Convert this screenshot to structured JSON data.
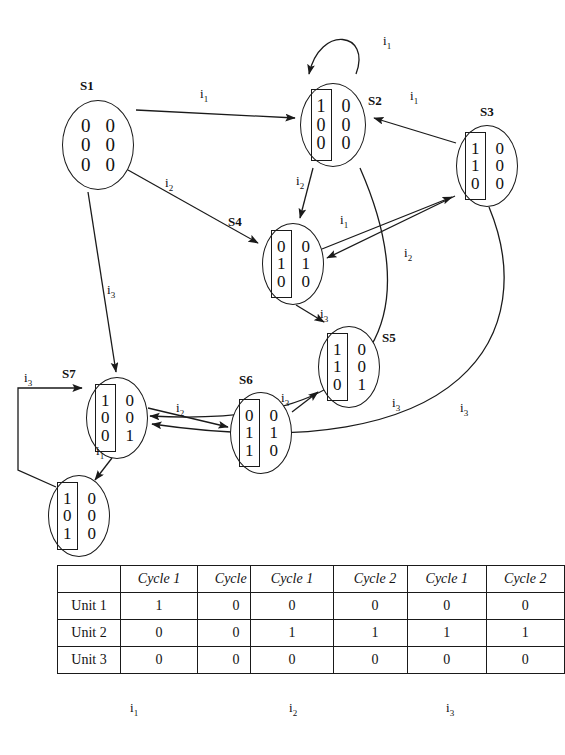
{
  "figure": {
    "type": "state-transition-diagram-with-tables",
    "inputs": [
      "i1",
      "i2",
      "i3"
    ]
  },
  "states": [
    {
      "id": "S1",
      "label": "S1",
      "boxed_column": false,
      "col1": [
        "0",
        "0",
        "0"
      ],
      "col2": [
        "0",
        "0",
        "0"
      ],
      "x": 62,
      "y": 100,
      "w": 72,
      "h": 90,
      "label_x": 80,
      "label_y": 78
    },
    {
      "id": "S2",
      "label": "S2",
      "boxed_column": true,
      "col1": [
        "1",
        "0",
        "0"
      ],
      "col2": [
        "0",
        "0",
        "0"
      ],
      "x": 300,
      "y": 83,
      "w": 66,
      "h": 84,
      "label_x": 368,
      "label_y": 93
    },
    {
      "id": "S3",
      "label": "S3",
      "boxed_column": true,
      "col1": [
        "1",
        "1",
        "0"
      ],
      "col2": [
        "0",
        "0",
        "0"
      ],
      "x": 456,
      "y": 125,
      "w": 62,
      "h": 82,
      "label_x": 480,
      "label_y": 104
    },
    {
      "id": "S4",
      "label": "S4",
      "boxed_column": true,
      "col1": [
        "0",
        "1",
        "0"
      ],
      "col2": [
        "0",
        "1",
        "0"
      ],
      "x": 262,
      "y": 223,
      "w": 62,
      "h": 82,
      "label_x": 228,
      "label_y": 214
    },
    {
      "id": "S5",
      "label": "S5",
      "boxed_column": true,
      "col1": [
        "1",
        "1",
        "0"
      ],
      "col2": [
        "0",
        "0",
        "1"
      ],
      "x": 318,
      "y": 326,
      "w": 62,
      "h": 82,
      "label_x": 382,
      "label_y": 330
    },
    {
      "id": "S6",
      "label": "S6",
      "boxed_column": true,
      "col1": [
        "0",
        "1",
        "1"
      ],
      "col2": [
        "0",
        "1",
        "0"
      ],
      "x": 230,
      "y": 392,
      "w": 62,
      "h": 82,
      "label_x": 239,
      "label_y": 372
    },
    {
      "id": "S7",
      "label": "S7",
      "boxed_column": true,
      "col1": [
        "1",
        "0",
        "0"
      ],
      "col2": [
        "0",
        "0",
        "1"
      ],
      "x": 86,
      "y": 377,
      "w": 62,
      "h": 82,
      "label_x": 62,
      "label_y": 366
    },
    {
      "id": "S8",
      "label": "",
      "boxed_column": true,
      "col1": [
        "1",
        "0",
        "1"
      ],
      "col2": [
        "0",
        "0",
        "0"
      ],
      "x": 48,
      "y": 475,
      "w": 62,
      "h": 82,
      "label_x": 0,
      "label_y": 0
    }
  ],
  "transitions": [
    {
      "from": "S1",
      "to": "S2",
      "input": "i1",
      "label_x": 200,
      "label_y": 86
    },
    {
      "from": "S1",
      "to": "S4",
      "input": "i2",
      "label_x": 165,
      "label_y": 175
    },
    {
      "from": "S1",
      "to": "S7",
      "input": "i3",
      "label_x": 107,
      "label_y": 282
    },
    {
      "from": "S2",
      "to": "S2",
      "input": "i1",
      "label_x": 383,
      "label_y": 33
    },
    {
      "from": "S2",
      "to": "S4",
      "input": "i2",
      "label_x": 296,
      "label_y": 173
    },
    {
      "from": "S2",
      "to": "S7",
      "input": "i3",
      "label_x": 392,
      "label_y": 395
    },
    {
      "from": "S3",
      "to": "S2",
      "input": "i1",
      "label_x": 410,
      "label_y": 88
    },
    {
      "from": "S3",
      "to": "S4",
      "input": "i2",
      "label_x": 404,
      "label_y": 245
    },
    {
      "from": "S3",
      "to": "S7",
      "input": "i3",
      "label_x": 460,
      "label_y": 400
    },
    {
      "from": "S4",
      "to": "S3",
      "input": "i1",
      "label_x": 340,
      "label_y": 212
    },
    {
      "from": "S4",
      "to": "S5",
      "input": "i3",
      "label_x": 320,
      "label_y": 306
    },
    {
      "from": "S6",
      "to": "S5",
      "input": "i3",
      "label_x": 281,
      "label_y": 390
    },
    {
      "from": "S7",
      "to": "S6",
      "input": "i2",
      "label_x": 176,
      "label_y": 400
    },
    {
      "from": "S7",
      "to": "S8",
      "input": "i1",
      "label_x": 96,
      "label_y": 443
    },
    {
      "from": "S8",
      "to": "S7",
      "input": "i3",
      "label_x": 24,
      "label_y": 370
    }
  ],
  "tables": [
    {
      "caption": "i3",
      "caption_sub": "3",
      "columns": [
        "Cycle 1",
        "Cycle 2"
      ],
      "row_labels": [
        "Unit 1",
        "Unit 2",
        "Unit 3"
      ],
      "rows": [
        [
          "1",
          "0"
        ],
        [
          "0",
          "0"
        ],
        [
          "0",
          "0"
        ]
      ],
      "x": 57,
      "y": 565,
      "rowlab_w": 58,
      "col_w": 72,
      "cap_x": 130,
      "cap_y": 700
    },
    {
      "caption": "i3",
      "caption_sub": "3",
      "columns": [
        "Cycle 1",
        "Cycle 2"
      ],
      "row_labels": [
        "",
        "",
        ""
      ],
      "rows": [
        [
          "0",
          "0"
        ],
        [
          "1",
          "1"
        ],
        [
          "0",
          "0"
        ]
      ],
      "x": 250,
      "y": 565,
      "rowlab_w": 0,
      "col_w": 78,
      "cap_x": 289,
      "cap_y": 700
    },
    {
      "caption": "i3",
      "caption_sub": "3",
      "columns": [
        "Cycle 1",
        "Cycle 2"
      ],
      "row_labels": [
        "",
        "",
        ""
      ],
      "rows": [
        [
          "0",
          "0"
        ],
        [
          "1",
          "1"
        ],
        [
          "0",
          "0"
        ]
      ],
      "x": 407,
      "y": 565,
      "rowlab_w": 0,
      "col_w": 78,
      "cap_x": 446,
      "cap_y": 700
    }
  ],
  "table_captions": [
    "i1",
    "i2",
    "i3"
  ],
  "table_subs": [
    "1",
    "2",
    "3"
  ],
  "colors": {
    "stroke": "#1a1a1a",
    "background": "#ffffff"
  }
}
